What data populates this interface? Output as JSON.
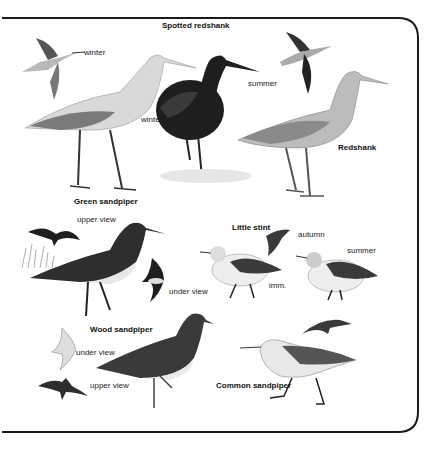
{
  "plate": {
    "species": [
      {
        "name": "Spotted redshank",
        "labels": [
          "winter",
          "winter",
          "summer"
        ]
      },
      {
        "name": "Redshank"
      },
      {
        "name": "Green sandpiper",
        "labels": [
          "upper view",
          "under view"
        ]
      },
      {
        "name": "Little stint",
        "labels": [
          "autumn",
          "summer",
          "imm."
        ]
      },
      {
        "name": "Wood sandpiper",
        "labels": [
          "under view",
          "upper view"
        ]
      },
      {
        "name": "Common sandpiper"
      }
    ]
  },
  "colors": {
    "border": "#1a1a1a",
    "background": "#ffffff",
    "dark_plumage": "#1e1e1e",
    "grey_plumage": "#8a8a8a",
    "light_plumage": "#e8e8e8"
  }
}
